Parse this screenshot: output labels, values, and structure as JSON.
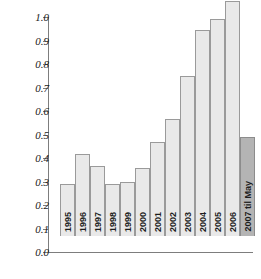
{
  "chart_data": {
    "type": "bar",
    "title": "",
    "subtitle": "",
    "xlabel": "",
    "ylabel": "",
    "categories": [
      "1995",
      "1996",
      "1997",
      "1998",
      "1999",
      "2000",
      "2001",
      "2002",
      "2003",
      "2004",
      "2005",
      "2006",
      "2007 til May"
    ],
    "values": [
      0.22,
      0.35,
      0.3,
      0.22,
      0.23,
      0.29,
      0.4,
      0.5,
      0.68,
      0.875,
      0.925,
      1.0,
      0.42
    ],
    "ylim": [
      0.0,
      1.0
    ],
    "ytick_labels": [
      "1.0",
      "0.9",
      "0.8",
      "0.7",
      "0.6",
      "0.5",
      "0.4",
      "0.3",
      "0.2",
      "0.1",
      "0.0"
    ],
    "ytick_values": [
      1.0,
      0.9,
      0.8,
      0.7,
      0.6,
      0.5,
      0.4,
      0.3,
      0.2,
      0.1,
      0.0
    ],
    "grid": false,
    "legend": null,
    "legend_position": "none",
    "annotations": [],
    "series": [
      {
        "name": "value",
        "values": [
          0.22,
          0.35,
          0.3,
          0.22,
          0.23,
          0.29,
          0.4,
          0.5,
          0.68,
          0.875,
          0.925,
          1.0,
          0.42
        ]
      }
    ],
    "bar_colors": {
      "default_fill": "#e9e9e9",
      "default_border": "#9a9a9a",
      "highlight_fill": "#b4b4b4",
      "highlight_border": "#8c8c8c"
    },
    "highlight_index": 12,
    "axis_color": "#7d7d7d",
    "background": "#ffffff"
  }
}
